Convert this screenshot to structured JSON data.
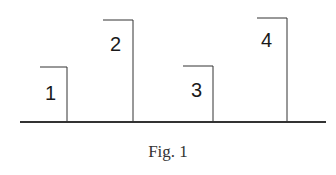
{
  "figure": {
    "caption": "Fig. 1",
    "pillars": [
      {
        "label": "1"
      },
      {
        "label": "2"
      },
      {
        "label": "3"
      },
      {
        "label": "4"
      }
    ]
  }
}
